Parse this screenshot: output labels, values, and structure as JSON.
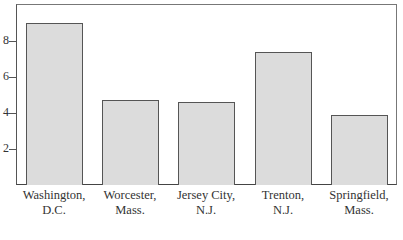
{
  "chart_data": {
    "type": "bar",
    "title": "",
    "xlabel": "",
    "ylabel": "",
    "categories": [
      "Washington, D.C.",
      "Worcester, Mass.",
      "Jersey City, N.J.",
      "Trenton, N.J.",
      "Springfield, Mass."
    ],
    "category_lines": [
      [
        "Washington,",
        "D.C."
      ],
      [
        "Worcester,",
        "Mass."
      ],
      [
        "Jersey City,",
        "N.J."
      ],
      [
        "Trenton,",
        "N.J."
      ],
      [
        "Springfield,",
        "Mass."
      ]
    ],
    "values": [
      9.0,
      4.7,
      4.6,
      7.4,
      3.9
    ],
    "yticks": [
      "2",
      "4",
      "6",
      "8"
    ],
    "ytick_values": [
      2,
      4,
      6,
      8
    ],
    "ylim": [
      0,
      10
    ],
    "grid": false,
    "legend": null,
    "bar_color": "#dcdcdc"
  }
}
